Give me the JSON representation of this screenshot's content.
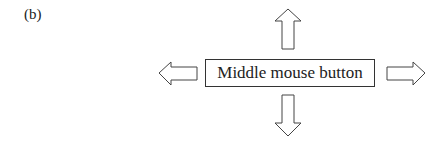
{
  "figure": {
    "label": "(b)",
    "center_box": "Middle mouse button",
    "arrows": [
      "up-arrow",
      "down-arrow",
      "left-arrow",
      "right-arrow"
    ],
    "stroke_color": "#444444"
  }
}
